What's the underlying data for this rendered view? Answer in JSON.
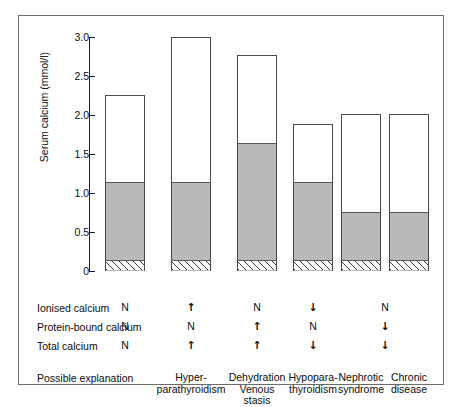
{
  "chart_data": {
    "type": "bar",
    "title": "",
    "xlabel": "",
    "ylabel": "Serum calcium (mmol/l)",
    "ylim": [
      0,
      3.0
    ],
    "yticks": [
      "0",
      "0.5",
      "1.0",
      "1.5",
      "2.0",
      "2.5",
      "3.0"
    ],
    "ytick_values": [
      0,
      0.5,
      1.0,
      1.5,
      2.0,
      2.5,
      3.0
    ],
    "grid": false,
    "legend": "none",
    "stacked": true,
    "segments": [
      "complexed calcium (hatched)",
      "ionised calcium (shaded)",
      "protein-bound calcium (white)"
    ],
    "categories": [
      "Normal",
      "Hyper-parathyroidism",
      "Dehydration Venous stasis",
      "Hypopara-thyroidism",
      "Nephrotic syndrome",
      "Chronic disease"
    ],
    "bars": [
      {
        "label": "Normal",
        "total": 2.26,
        "ionised_top": 1.14,
        "hatch_top": 0.13
      },
      {
        "label": "Hyperparathyroidism",
        "total": 3.0,
        "ionised_top": 1.14,
        "hatch_top": 0.13
      },
      {
        "label": "Dehydration",
        "total": 2.77,
        "ionised_top": 1.64,
        "hatch_top": 0.13
      },
      {
        "label": "Hypoparathyroidism",
        "total": 1.88,
        "ionised_top": 1.14,
        "hatch_top": 0.13
      },
      {
        "label": "Nephrotic syndrome",
        "total": 2.01,
        "ionised_top": 0.75,
        "hatch_top": 0.13
      },
      {
        "label": "Chronic disease",
        "total": 2.01,
        "ionised_top": 0.75,
        "hatch_top": 0.13
      }
    ]
  },
  "table": {
    "row_labels": [
      "Ionised calcium",
      "Protein-bound calcium",
      "Total calcium",
      "Possible explanation"
    ],
    "columns": [
      {
        "name_lines": [
          "Normal"
        ],
        "ionised": "N",
        "protein_bound": "N",
        "total": "N"
      },
      {
        "name_lines": [
          "Hyper-",
          "parathyroidism"
        ],
        "ionised": "↑",
        "protein_bound": "N",
        "total": "↑"
      },
      {
        "name_lines": [
          "Dehydration",
          "Venous",
          "stasis"
        ],
        "ionised": "N",
        "protein_bound": "↑",
        "total": "↑"
      },
      {
        "name_lines": [
          "Hypopara-",
          "thyroidism"
        ],
        "ionised": "↓",
        "protein_bound": "N",
        "total": "↓"
      },
      {
        "name_lines": [
          "Nephrotic",
          "syndrome"
        ],
        "ionised": "N",
        "protein_bound": "↓",
        "total": "↓"
      },
      {
        "name_lines": [
          "Chronic",
          "disease"
        ],
        "ionised": "",
        "protein_bound": "",
        "total": ""
      }
    ],
    "shared_symbol_note": "symbols centred between Nephrotic syndrome and Chronic disease"
  },
  "colors": {
    "ionised_fill": "#b9b9b9",
    "protein_fill": "#ffffff",
    "outline": "#4a4a4a",
    "frame": "#6d6d6d",
    "text": "#0c0c0c"
  }
}
